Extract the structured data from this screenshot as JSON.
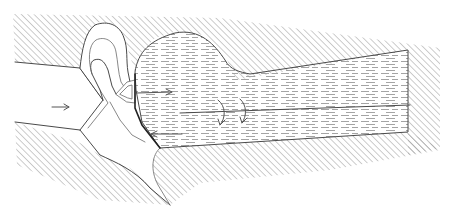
{
  "diagram": {
    "width": 457,
    "height": 223,
    "colors": {
      "background": "#ffffff",
      "outline": "#4a4a4a",
      "hatch": "#9a9a9a",
      "fluid_dash": "#9a9a9a",
      "arrow": "#555555"
    },
    "regions": [
      {
        "name": "upper-wall",
        "style": "diagonal-hatch"
      },
      {
        "name": "lower-wall",
        "style": "diagonal-hatch"
      },
      {
        "name": "inlet-channel",
        "style": "blank"
      },
      {
        "name": "hooked-flap",
        "style": "outline"
      },
      {
        "name": "valve-nozzle",
        "style": "outline"
      },
      {
        "name": "fluid-chamber",
        "style": "horizontal-dashes"
      }
    ],
    "arrows": [
      {
        "name": "inlet-flow-arrow",
        "direction": "right"
      },
      {
        "name": "outflow-jet-arrow",
        "direction": "right"
      },
      {
        "name": "recirculation-arrow-1",
        "direction": "curved-down"
      },
      {
        "name": "recirculation-arrow-2",
        "direction": "curved-down"
      },
      {
        "name": "return-flow-arrow",
        "direction": "left"
      }
    ],
    "labels": []
  }
}
